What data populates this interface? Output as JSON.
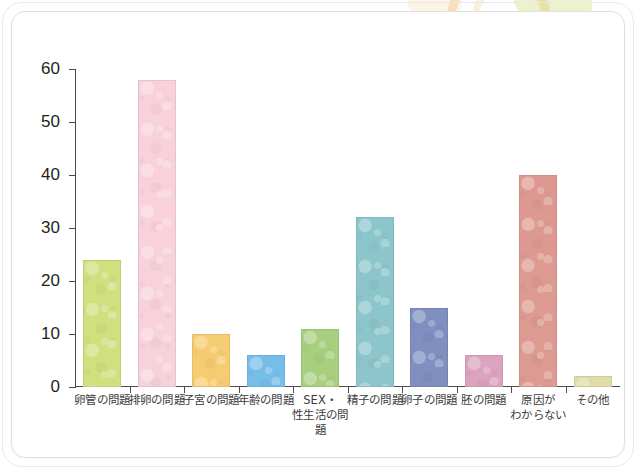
{
  "chart_data": {
    "type": "bar",
    "title": "",
    "subtitle": "",
    "xlabel": "",
    "ylabel": "",
    "ylim": [
      0,
      60
    ],
    "y_ticks": [
      0,
      10,
      20,
      30,
      40,
      50,
      60
    ],
    "grid": false,
    "legend": "none",
    "categories": [
      "卵管の問題",
      "排卵の問題",
      "子宮の問題",
      "年齢の問題",
      "SEX・\n性生活の問題",
      "精子の問題",
      "卵子の問題",
      "胚の問題",
      "原因が\nわからない",
      "その他"
    ],
    "category_lines": [
      [
        "卵管の問題"
      ],
      [
        "排卵の問題"
      ],
      [
        "子宮の問題"
      ],
      [
        "年齢の問題"
      ],
      [
        "SEX・",
        "性生活の問題"
      ],
      [
        "精子の問題"
      ],
      [
        "卵子の問題"
      ],
      [
        "胚の問題"
      ],
      [
        "原因が",
        "わからない"
      ],
      [
        "その他"
      ]
    ],
    "values": [
      24,
      58,
      10,
      6,
      11,
      32,
      15,
      6,
      40,
      2
    ],
    "bar_colors": [
      "#cfe07f",
      "#f8d2da",
      "#f6cc70",
      "#77bde9",
      "#a8cf7e",
      "#8cc6cc",
      "#7f8fc0",
      "#dba3bf",
      "#dd9a91",
      "#e0dca6"
    ]
  },
  "axis": {
    "y_tick_labels": [
      "60",
      "50",
      "40",
      "30",
      "20",
      "10",
      "0"
    ]
  },
  "decor": {
    "ring_color": "#f3bc78",
    "leaf_color": "#cfe07f"
  }
}
